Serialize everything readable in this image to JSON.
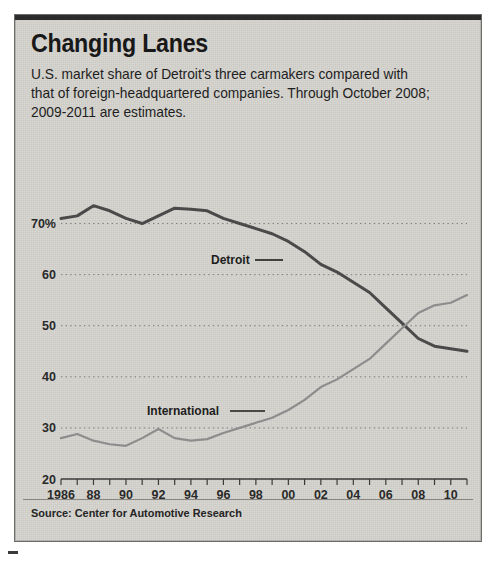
{
  "title": "Changing Lanes",
  "subtitle": "U.S. market share of Detroit's three carmakers compared with that of foreign-headquartered companies. Through October 2008; 2009-2011 are estimates.",
  "source": "Source: Center for Automotive Research",
  "labels": {
    "detroit": "Detroit",
    "international": "International"
  },
  "axis": {
    "y_ticks": [
      "70%",
      "60",
      "50",
      "40",
      "30",
      "20"
    ],
    "y_values": [
      70,
      60,
      50,
      40,
      30,
      20
    ],
    "x_ticks": [
      "1986",
      "88",
      "90",
      "92",
      "94",
      "96",
      "98",
      "00",
      "02",
      "04",
      "06",
      "08",
      "10"
    ],
    "x_tick_years": [
      1986,
      1988,
      1990,
      1992,
      1994,
      1996,
      1998,
      2000,
      2002,
      2004,
      2006,
      2008,
      2010
    ]
  },
  "colors": {
    "detroit_line": "#4a4a4a",
    "international_line": "#8d8d8d",
    "grid": "#7a7a7a",
    "paper": "#d8d6d1",
    "ink": "#1d1d1d"
  },
  "chart_data": {
    "type": "line",
    "title": "Changing Lanes",
    "subtitle": "U.S. market share of Detroit's three carmakers compared with that of foreign-headquartered companies. Through October 2008; 2009-2011 are estimates.",
    "xlabel": "",
    "ylabel": "U.S. market share (%)",
    "xlim": [
      1986,
      2011
    ],
    "ylim": [
      20,
      75
    ],
    "yticks": [
      20,
      30,
      40,
      50,
      60,
      70
    ],
    "grid": true,
    "legend": "inline-annotations",
    "x": [
      1986,
      1987,
      1988,
      1989,
      1990,
      1991,
      1992,
      1993,
      1994,
      1995,
      1996,
      1997,
      1998,
      1999,
      2000,
      2001,
      2002,
      2003,
      2004,
      2005,
      2006,
      2007,
      2008,
      2009,
      2010,
      2011
    ],
    "series": [
      {
        "name": "Detroit",
        "color": "#4a4a4a",
        "values": [
          71.0,
          71.5,
          73.5,
          72.5,
          71.0,
          70.0,
          71.5,
          73.0,
          72.8,
          72.5,
          71.0,
          70.0,
          69.0,
          68.0,
          66.5,
          64.5,
          62.0,
          60.5,
          58.5,
          56.5,
          53.5,
          50.5,
          47.5,
          46.0,
          45.5,
          45.0
        ]
      },
      {
        "name": "International",
        "color": "#8d8d8d",
        "values": [
          28.0,
          28.8,
          27.5,
          26.8,
          26.5,
          28.0,
          29.8,
          28.0,
          27.5,
          27.8,
          29.0,
          30.0,
          31.0,
          32.0,
          33.5,
          35.5,
          38.0,
          39.5,
          41.5,
          43.5,
          46.5,
          49.5,
          52.5,
          54.0,
          54.5,
          56.0
        ]
      }
    ],
    "annotations": [
      {
        "text": "Detroit",
        "x": 1996,
        "y": 62
      },
      {
        "text": "International",
        "x": 1993,
        "y": 36
      }
    ]
  }
}
